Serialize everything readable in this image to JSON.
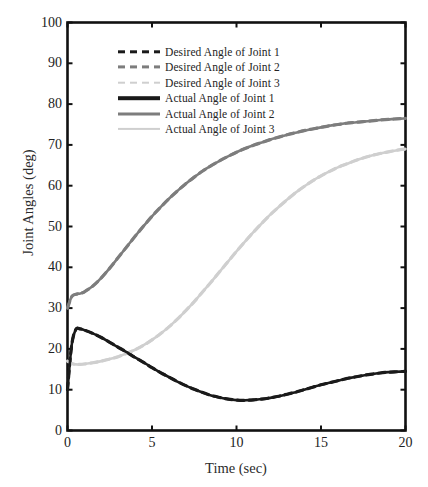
{
  "chart_data": {
    "type": "line",
    "title": "",
    "xlabel": "Time (sec)",
    "ylabel": "Joint Angles (deg)",
    "xlim": [
      0,
      20
    ],
    "ylim": [
      0,
      100
    ],
    "xticks": [
      0,
      5,
      10,
      15,
      20
    ],
    "yticks": [
      0,
      10,
      20,
      30,
      40,
      50,
      60,
      70,
      80,
      90,
      100
    ],
    "grid": false,
    "legend_position": "upper center",
    "colors": {
      "joint1": "#1a1a1a",
      "joint2": "#7d7d7d",
      "joint3": "#cfcfcf",
      "axis": "#111111",
      "background": "#ffffff"
    },
    "x": [
      0,
      0.25,
      0.5,
      0.75,
      1,
      1.5,
      2,
      2.5,
      3,
      3.5,
      4,
      4.5,
      5,
      5.5,
      6,
      6.5,
      7,
      7.5,
      8,
      8.5,
      9,
      9.5,
      10,
      10.5,
      11,
      11.5,
      12,
      12.5,
      13,
      13.5,
      14,
      14.5,
      15,
      15.5,
      16,
      16.5,
      17,
      17.5,
      18,
      18.5,
      19,
      19.5,
      20
    ],
    "series": [
      {
        "name": "Desired Angle of Joint 1",
        "key": "desired_joint1",
        "style": "dashed",
        "color": "#1a1a1a",
        "width": 3.2,
        "values": [
          10.0,
          21.0,
          24.8,
          24.9,
          24.6,
          23.8,
          22.8,
          21.6,
          20.4,
          19.2,
          17.9,
          16.7,
          15.4,
          14.2,
          13.1,
          12.0,
          11.0,
          10.1,
          9.3,
          8.6,
          8.1,
          7.7,
          7.45,
          7.4,
          7.5,
          7.7,
          8.0,
          8.4,
          8.9,
          9.4,
          10.0,
          10.6,
          11.2,
          11.7,
          12.2,
          12.7,
          13.1,
          13.5,
          13.8,
          14.1,
          14.3,
          14.4,
          14.5
        ]
      },
      {
        "name": "Desired Angle of Joint 2",
        "key": "desired_joint2",
        "style": "dashed",
        "color": "#7d7d7d",
        "width": 3.2,
        "values": [
          30.0,
          32.8,
          33.4,
          33.6,
          34.0,
          35.4,
          37.4,
          39.8,
          42.4,
          45.0,
          47.6,
          50.1,
          52.5,
          54.7,
          56.8,
          58.7,
          60.5,
          62.1,
          63.6,
          64.9,
          66.1,
          67.2,
          68.2,
          69.1,
          69.9,
          70.6,
          71.3,
          71.9,
          72.5,
          73.0,
          73.5,
          73.9,
          74.3,
          74.7,
          75.0,
          75.3,
          75.5,
          75.7,
          75.9,
          76.1,
          76.25,
          76.4,
          76.5
        ]
      },
      {
        "name": "Desired Angle of Joint 3",
        "key": "desired_joint3",
        "style": "dashed",
        "color": "#cfcfcf",
        "width": 3.2,
        "values": [
          17.0,
          16.4,
          16.2,
          16.2,
          16.3,
          16.6,
          17.0,
          17.5,
          18.1,
          18.9,
          19.8,
          20.9,
          22.2,
          23.7,
          25.4,
          27.3,
          29.4,
          31.6,
          34.0,
          36.4,
          38.9,
          41.4,
          43.9,
          46.3,
          48.6,
          50.8,
          52.9,
          54.8,
          56.6,
          58.3,
          59.8,
          61.2,
          62.4,
          63.5,
          64.5,
          65.3,
          66.1,
          66.8,
          67.4,
          67.9,
          68.3,
          68.7,
          69.0
        ]
      },
      {
        "name": "Actual Angle of Joint 1",
        "key": "actual_joint1",
        "style": "solid",
        "color": "#1a1a1a",
        "width": 2.6,
        "values": [
          10.0,
          21.0,
          24.8,
          24.9,
          24.6,
          23.8,
          22.8,
          21.6,
          20.4,
          19.2,
          17.9,
          16.7,
          15.4,
          14.2,
          13.1,
          12.0,
          11.0,
          10.1,
          9.3,
          8.6,
          8.1,
          7.7,
          7.45,
          7.4,
          7.5,
          7.7,
          8.0,
          8.4,
          8.9,
          9.4,
          10.0,
          10.6,
          11.2,
          11.7,
          12.2,
          12.7,
          13.1,
          13.5,
          13.8,
          14.1,
          14.3,
          14.4,
          14.5
        ]
      },
      {
        "name": "Actual Angle of Joint 2",
        "key": "actual_joint2",
        "style": "solid",
        "color": "#7d7d7d",
        "width": 2.6,
        "values": [
          30.0,
          32.8,
          33.4,
          33.6,
          34.0,
          35.4,
          37.4,
          39.8,
          42.4,
          45.0,
          47.6,
          50.1,
          52.5,
          54.7,
          56.8,
          58.7,
          60.5,
          62.1,
          63.6,
          64.9,
          66.1,
          67.2,
          68.2,
          69.1,
          69.9,
          70.6,
          71.3,
          71.9,
          72.5,
          73.0,
          73.5,
          73.9,
          74.3,
          74.7,
          75.0,
          75.3,
          75.5,
          75.7,
          75.9,
          76.1,
          76.25,
          76.4,
          76.5
        ]
      },
      {
        "name": "Actual Angle of Joint 3",
        "key": "actual_joint3",
        "style": "solid",
        "color": "#cfcfcf",
        "width": 2.6,
        "values": [
          17.0,
          16.4,
          16.2,
          16.2,
          16.3,
          16.6,
          17.0,
          17.5,
          18.1,
          18.9,
          19.8,
          20.9,
          22.2,
          23.7,
          25.4,
          27.3,
          29.4,
          31.6,
          34.0,
          36.4,
          38.9,
          41.4,
          43.9,
          46.3,
          48.6,
          50.8,
          52.9,
          54.8,
          56.6,
          58.3,
          59.8,
          61.2,
          62.4,
          63.5,
          64.5,
          65.3,
          66.1,
          66.8,
          67.4,
          67.9,
          68.3,
          68.7,
          69.0
        ]
      }
    ],
    "legend_entries": [
      {
        "label": "Desired Angle of Joint 1",
        "style": "dashed",
        "color": "#1a1a1a",
        "width": 3.4
      },
      {
        "label": "Desired Angle of Joint 2",
        "style": "dashed",
        "color": "#7d7d7d",
        "width": 3.2
      },
      {
        "label": "Desired Angle of Joint 3",
        "style": "dashed",
        "color": "#cfcfcf",
        "width": 2.6
      },
      {
        "label": "Actual Angle of Joint 1",
        "style": "solid",
        "color": "#1a1a1a",
        "width": 3.6
      },
      {
        "label": "Actual Angle of Joint 2",
        "style": "solid",
        "color": "#7d7d7d",
        "width": 3.0
      },
      {
        "label": "Actual Angle of Joint 3",
        "style": "solid",
        "color": "#cfcfcf",
        "width": 2.2
      }
    ]
  }
}
